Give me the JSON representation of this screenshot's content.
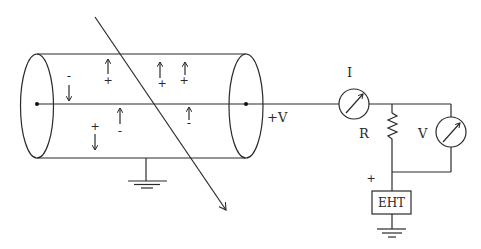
{
  "diagram": {
    "type": "circuit-schematic",
    "labels": {
      "voltage_terminal": "+V",
      "current_meter": "I",
      "resistor": "R",
      "voltmeter": "V",
      "supply_polarity": "+",
      "supply": "EHT"
    },
    "charges": [
      {
        "sign": "-",
        "direction": "down"
      },
      {
        "sign": "+",
        "direction": "up"
      },
      {
        "sign": "+",
        "direction": "up"
      },
      {
        "sign": "+",
        "direction": "up"
      },
      {
        "sign": "+",
        "direction": "down"
      },
      {
        "sign": "-",
        "direction": "up"
      },
      {
        "sign": "-",
        "direction": "up"
      }
    ],
    "charge_glyphs": {
      "plus": "+",
      "minus": "-"
    },
    "components": [
      "cylinder-chamber",
      "central-electrode",
      "ground-left",
      "ionizing-ray",
      "ammeter",
      "resistor",
      "voltmeter",
      "eht-supply",
      "ground-right"
    ],
    "colors": {
      "stroke": "#2a2a2a",
      "background": "#ffffff"
    }
  }
}
